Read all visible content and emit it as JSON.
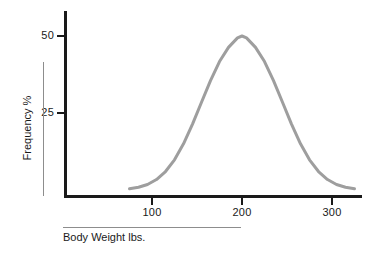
{
  "chart_data": {
    "type": "line",
    "title": "",
    "subtitle": "",
    "xlabel": "Body Weight   lbs.",
    "ylabel": "Frequency   %",
    "xlabel_parts": {
      "quantity": "Body Weight",
      "unit": "lbs."
    },
    "ylabel_parts": {
      "quantity": "Frequency",
      "unit": "%"
    },
    "xtick_labels": [
      "100",
      "200",
      "300"
    ],
    "xtick_values": [
      100,
      200,
      300
    ],
    "ytick_labels": [
      "25",
      "50"
    ],
    "ytick_values": [
      25,
      50
    ],
    "xlim": [
      60,
      330
    ],
    "ylim": [
      0,
      55
    ],
    "grid": false,
    "legend": null,
    "annotations": [],
    "series": [
      {
        "name": "Body weight distribution",
        "shape": "normal-bell-curve",
        "color": "#9e9e9e",
        "line_width": 3,
        "peak_x": 200,
        "peak_y": 50,
        "std_dev": 45,
        "x": [
          75,
          85,
          95,
          105,
          115,
          125,
          135,
          145,
          155,
          165,
          175,
          185,
          195,
          200,
          205,
          215,
          225,
          235,
          245,
          255,
          265,
          275,
          285,
          295,
          305,
          315,
          325
        ],
        "values": [
          0.4,
          0.9,
          1.8,
          3.4,
          6.0,
          9.8,
          15.0,
          21.4,
          28.5,
          35.5,
          41.7,
          46.3,
          49.4,
          50.0,
          49.4,
          46.3,
          41.7,
          35.5,
          28.5,
          21.4,
          15.0,
          9.8,
          6.0,
          3.4,
          1.8,
          0.9,
          0.4
        ]
      }
    ]
  },
  "figure": {
    "background_color": "#ffffff",
    "axis_color": "#1a1a1a",
    "curve_color": "#9e9e9e",
    "rule_color": "#8d8d8d"
  }
}
